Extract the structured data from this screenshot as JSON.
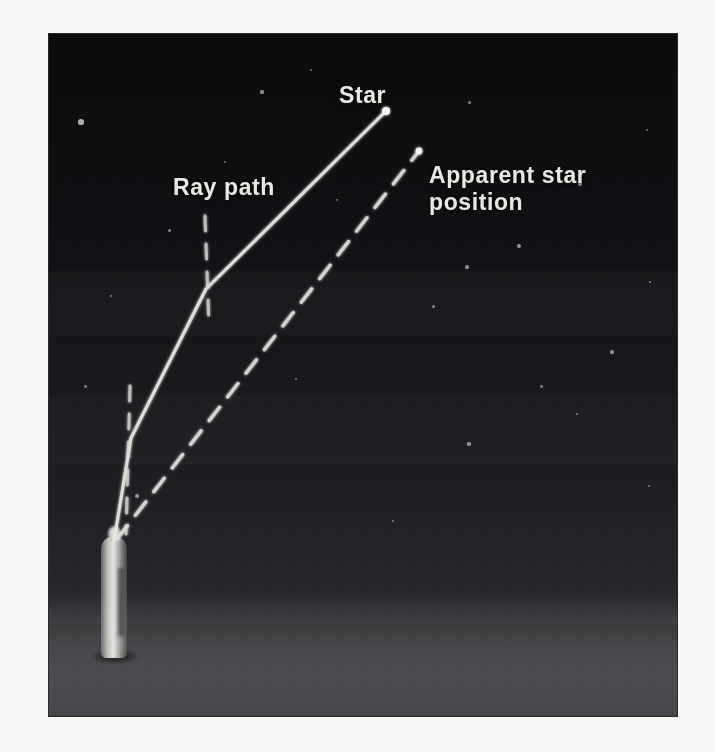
{
  "figure": {
    "kind": "astronomical-refraction-diagram",
    "scene": "night-sky-photograph",
    "labels": {
      "star": "Star",
      "ray_path": "Ray path",
      "apparent_star_position": "Apparent star\nposition"
    },
    "elements": {
      "observer": "observer-figure",
      "ground": "ground-plane",
      "sky": "night-sky"
    },
    "colors": {
      "label_text": "#e9e9e4",
      "line": "#e6e6e2",
      "sky_top": "#0b0b0d",
      "sky_bottom": "#303034",
      "ground": "#4c4c50",
      "border": "#2a2a2a",
      "page_background": "#f7f7f6"
    },
    "points": {
      "observer_eye": {
        "x": 65,
        "y": 507
      },
      "lower_bend": {
        "x": 82,
        "y": 404
      },
      "upper_bend": {
        "x": 157,
        "y": 255
      },
      "star": {
        "x": 337,
        "y": 77
      },
      "apparent_star": {
        "x": 370,
        "y": 117
      }
    },
    "lines": [
      {
        "name": "ray-path-solid",
        "style": "solid",
        "from": "observer_eye",
        "via": [
          "lower_bend",
          "upper_bend"
        ],
        "to": "star"
      },
      {
        "name": "apparent-sightline-dashed",
        "style": "dashed",
        "from": "observer_eye",
        "to": "apparent_star"
      },
      {
        "name": "vertical-reference-lower",
        "style": "dashed",
        "from": {
          "x": 82,
          "y": 352
        },
        "to": {
          "x": 78,
          "y": 507
        }
      },
      {
        "name": "vertical-reference-upper",
        "style": "dashed",
        "from": {
          "x": 157,
          "y": 182
        },
        "to": {
          "x": 160,
          "y": 290
        }
      }
    ],
    "stars": [
      {
        "x": 32,
        "y": 88,
        "r": 2.6
      },
      {
        "x": 213,
        "y": 58,
        "r": 1.6
      },
      {
        "x": 262,
        "y": 36,
        "r": 1.4
      },
      {
        "x": 120,
        "y": 196,
        "r": 1.5
      },
      {
        "x": 420,
        "y": 68,
        "r": 1.5
      },
      {
        "x": 531,
        "y": 150,
        "r": 2.2
      },
      {
        "x": 470,
        "y": 212,
        "r": 2.0
      },
      {
        "x": 418,
        "y": 233,
        "r": 1.6
      },
      {
        "x": 384,
        "y": 272,
        "r": 1.5
      },
      {
        "x": 563,
        "y": 318,
        "r": 1.6
      },
      {
        "x": 492,
        "y": 352,
        "r": 1.5
      },
      {
        "x": 528,
        "y": 380,
        "r": 1.4
      },
      {
        "x": 420,
        "y": 410,
        "r": 1.8
      },
      {
        "x": 88,
        "y": 462,
        "r": 1.7
      },
      {
        "x": 36,
        "y": 352,
        "r": 1.5
      },
      {
        "x": 247,
        "y": 345,
        "r": 1.3
      },
      {
        "x": 601,
        "y": 248,
        "r": 1.4
      },
      {
        "x": 344,
        "y": 487,
        "r": 1.4
      },
      {
        "x": 600,
        "y": 452,
        "r": 1.3
      },
      {
        "x": 176,
        "y": 128,
        "r": 1.2
      },
      {
        "x": 62,
        "y": 262,
        "r": 1.3
      },
      {
        "x": 288,
        "y": 166,
        "r": 1.2
      },
      {
        "x": 598,
        "y": 96,
        "r": 1.2
      }
    ]
  }
}
